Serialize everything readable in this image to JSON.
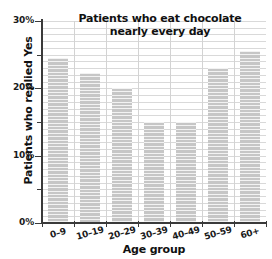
{
  "chart_data": {
    "type": "bar",
    "title": "Patients who eat chocolate nearly every day",
    "title_lines": [
      "Patients who eat chocolate",
      "nearly every day"
    ],
    "xlabel": "Age group",
    "ylabel": "Patients who replied Yes",
    "categories": [
      "0–9",
      "10–19",
      "20–29",
      "30–39",
      "40–49",
      "50–59",
      "60+"
    ],
    "values": [
      24.5,
      22.3,
      20.0,
      15.0,
      15.0,
      23.0,
      25.5
    ],
    "value_unit": "%",
    "ylim": [
      0,
      30
    ],
    "ytick_labels": [
      "0%",
      "10%",
      "20%",
      "30%"
    ],
    "ytick_values": [
      0,
      10,
      20,
      30
    ],
    "yminor_tick_values": [
      5,
      15,
      25
    ],
    "grid": true,
    "legend": "none",
    "bar_color": "#c6c6c6",
    "axis_color": "#3a3a3a",
    "grid_color": "#d9d9d9",
    "text_color": "#111111"
  }
}
